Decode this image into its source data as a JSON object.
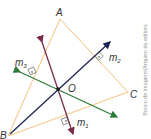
{
  "diagram": {
    "points": {
      "A": {
        "label": "A",
        "x": 60,
        "y": 19
      },
      "B": {
        "label": "B",
        "x": 8,
        "y": 136
      },
      "C": {
        "label": "C",
        "x": 128,
        "y": 92
      },
      "O": {
        "label": "O",
        "x": 58,
        "y": 89
      }
    },
    "lines": [
      {
        "name": "m1",
        "label": "m",
        "sub": "1",
        "color": "#7a2a4a"
      },
      {
        "name": "m2",
        "label": "m",
        "sub": "2",
        "color": "#1e2452"
      },
      {
        "name": "m3",
        "label": "m",
        "sub": "3",
        "color": "#2e7a3a"
      }
    ],
    "triangle_color": "#f2c27a"
  },
  "credit": "Banco de imagens/Arquivo da editora"
}
